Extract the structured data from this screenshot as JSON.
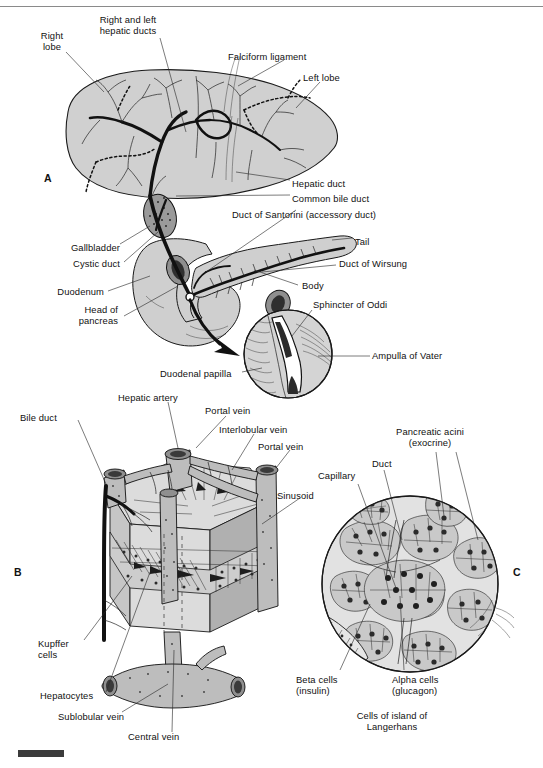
{
  "figure": {
    "panels": [
      {
        "id": "A",
        "letter": "A",
        "title": "Liver, gallbladder, and pancreas gross anatomy"
      },
      {
        "id": "B",
        "letter": "B",
        "title": "Liver lobule microscopic structure"
      },
      {
        "id": "C",
        "letter": "C",
        "title": "Pancreatic acini and island of Langerhans"
      }
    ]
  },
  "panel_a": {
    "letter": "A",
    "labels": [
      {
        "name": "right-lobe",
        "text": "Right\nlobe",
        "x": 52,
        "y": 30,
        "align": "center"
      },
      {
        "name": "right-and-left-hepatic-ducts",
        "text": "Right and left\nhepatic ducts",
        "x": 128,
        "y": 14,
        "align": "center"
      },
      {
        "name": "falciform-ligament",
        "text": "Falciform ligament",
        "x": 228,
        "y": 51,
        "align": "left"
      },
      {
        "name": "left-lobe",
        "text": "Left lobe",
        "x": 303,
        "y": 72,
        "align": "left"
      },
      {
        "name": "hepatic-duct",
        "text": "Hepatic duct",
        "x": 292,
        "y": 178,
        "align": "left"
      },
      {
        "name": "common-bile-duct",
        "text": "Common bile duct",
        "x": 292,
        "y": 193,
        "align": "left"
      },
      {
        "name": "duct-of-santorini",
        "text": "Duct of Santorini (accessory duct)",
        "x": 240,
        "y": 209,
        "align": "left"
      },
      {
        "name": "tail",
        "text": "Tail",
        "x": 355,
        "y": 236,
        "align": "left"
      },
      {
        "name": "duct-of-wirsung",
        "text": "Duct of Wirsung",
        "x": 339,
        "y": 263,
        "align": "left"
      },
      {
        "name": "body",
        "text": "Body",
        "x": 300,
        "y": 284,
        "align": "left"
      },
      {
        "name": "sphincter-of-oddi",
        "text": "Sphincter of Oddi",
        "x": 305,
        "y": 303,
        "align": "left"
      },
      {
        "name": "ampulla-of-vater",
        "text": "Ampulla of Vater",
        "x": 372,
        "y": 353,
        "align": "left"
      },
      {
        "name": "gallbladder",
        "text": "Gallbladder",
        "x": 66,
        "y": 246,
        "align": "left"
      },
      {
        "name": "cystic-duct",
        "text": "Cystic duct",
        "x": 69,
        "y": 262,
        "align": "left"
      },
      {
        "name": "duodenum",
        "text": "Duodenum",
        "x": 52,
        "y": 289,
        "align": "left"
      },
      {
        "name": "head-of-pancreas",
        "text": "Head of\npancreas",
        "x": 80,
        "y": 308,
        "align": "left"
      },
      {
        "name": "duodenal-papilla",
        "text": "Duodenal papilla",
        "x": 168,
        "y": 371,
        "align": "left"
      }
    ]
  },
  "panel_b": {
    "letter": "B",
    "labels": [
      {
        "name": "bile-duct",
        "text": "Bile duct",
        "x": 48,
        "y": 415,
        "align": "left"
      },
      {
        "name": "hepatic-artery",
        "text": "Hepatic artery",
        "x": 120,
        "y": 396,
        "align": "left"
      },
      {
        "name": "portal-vein-top",
        "text": "Portal vein",
        "x": 200,
        "y": 409,
        "align": "left"
      },
      {
        "name": "interlobular-vein",
        "text": "Interlobular vein",
        "x": 215,
        "y": 428,
        "align": "left"
      },
      {
        "name": "portal-vein-right",
        "text": "Portal vein",
        "x": 262,
        "y": 444,
        "align": "left"
      },
      {
        "name": "sinusoid",
        "text": "Sinusoid",
        "x": 278,
        "y": 494,
        "align": "left"
      },
      {
        "name": "kupffer-cells",
        "text": "Kupffer\ncells",
        "x": 43,
        "y": 643,
        "align": "left"
      },
      {
        "name": "hepatocytes",
        "text": "Hepatocytes",
        "x": 46,
        "y": 694,
        "align": "left"
      },
      {
        "name": "sublobular-vein",
        "text": "Sublobular vein",
        "x": 63,
        "y": 715,
        "align": "left"
      },
      {
        "name": "central-vein",
        "text": "Central vein",
        "x": 131,
        "y": 735,
        "align": "left"
      }
    ]
  },
  "panel_c": {
    "letter": "C",
    "labels": [
      {
        "name": "pancreatic-acini",
        "text": "Pancreatic acini\n(exocrine)",
        "x": 392,
        "y": 430,
        "align": "center"
      },
      {
        "name": "duct",
        "text": "Duct",
        "x": 372,
        "y": 462,
        "align": "left"
      },
      {
        "name": "capillary",
        "text": "Capillary",
        "x": 322,
        "y": 473,
        "align": "left"
      },
      {
        "name": "beta-cells",
        "text": "Beta cells\n(insulin)",
        "x": 306,
        "y": 678,
        "align": "left"
      },
      {
        "name": "alpha-cells",
        "text": "Alpha cells\n(glucagon)",
        "x": 392,
        "y": 678,
        "align": "left"
      },
      {
        "name": "cells-of-island-of-langerhans",
        "text": "Cells of island of\nLangerhans",
        "x": 372,
        "y": 713,
        "align": "center"
      }
    ]
  },
  "colors": {
    "organ_fill": "#d0d0d0",
    "ink": "#111111",
    "rule": "#8a8a8a",
    "scalebar": "#3b3b3b"
  }
}
